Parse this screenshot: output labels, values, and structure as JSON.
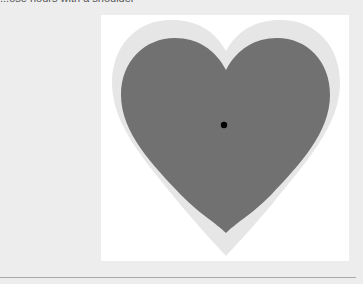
{
  "header": {
    "clipped_text": "...ose hours with a shoulder"
  },
  "heart_panel": {
    "outer_heart": {
      "shape": "heart",
      "color": "#e6e6e6"
    },
    "inner_heart": {
      "shape": "heart",
      "color": "#717171"
    },
    "center_dot": {
      "shape": "circle",
      "color": "#000000"
    },
    "background_color": "#ffffff"
  },
  "page": {
    "background_color": "#ededed",
    "divider_color": "#a9a9a9"
  }
}
